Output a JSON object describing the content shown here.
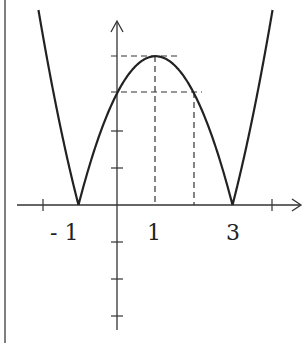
{
  "chart_data": {
    "type": "line",
    "title": "",
    "function": "y = |(x+1)(x-3)| = |x^2 - 2x - 3|",
    "xlabel": "",
    "ylabel": "",
    "x_tick_labels": [
      "- 1",
      "1",
      "3"
    ],
    "x_ticks": [
      -2,
      -1,
      1,
      2,
      3,
      4
    ],
    "y_ticks": [
      -3,
      -2,
      -1,
      1,
      2,
      3,
      4
    ],
    "zeros": [
      -1,
      3
    ],
    "vertex": {
      "x": 1,
      "y": 4
    },
    "dashed_guides": [
      {
        "type": "horizontal",
        "y": 4,
        "from_x": 0,
        "to_x": 1.6
      },
      {
        "type": "horizontal",
        "y": 3,
        "from_x": 0,
        "to_x": 2.2
      },
      {
        "type": "vertical",
        "x": 1,
        "from_y": 0,
        "to_y": 4
      },
      {
        "type": "vertical",
        "x": 2,
        "from_y": 0,
        "to_y": 3
      }
    ],
    "sample_points": [
      {
        "x": -2,
        "y": 5
      },
      {
        "x": -1,
        "y": 0
      },
      {
        "x": 0,
        "y": 3
      },
      {
        "x": 1,
        "y": 4
      },
      {
        "x": 2,
        "y": 3
      },
      {
        "x": 3,
        "y": 0
      },
      {
        "x": 4,
        "y": 5
      }
    ],
    "grid": false,
    "legend": null
  },
  "labels": {
    "neg_one": "- 1",
    "one": "1",
    "three": "3"
  },
  "colors": {
    "curve": "#222222",
    "axes": "#333333",
    "dashed": "#333333",
    "border": "#555555"
  }
}
